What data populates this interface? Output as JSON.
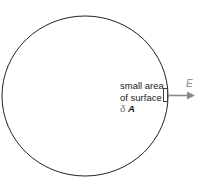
{
  "diagram": {
    "label_line1": "small area",
    "label_line2": "of surface",
    "delta_symbol": "δ",
    "area_symbol": "A",
    "field_symbol": "E",
    "colors": {
      "outline": "#222222",
      "arrow": "#8a8a8a",
      "field_label": "#8a8a8a"
    }
  }
}
